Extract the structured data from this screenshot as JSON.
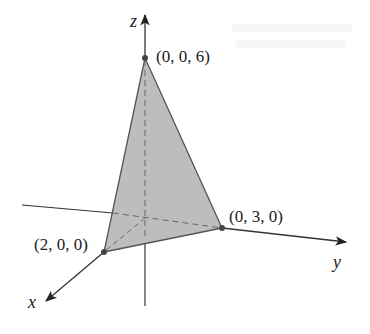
{
  "diagram": {
    "type": "3d-coordinate-plane-intercepts",
    "axes": {
      "x": {
        "label": "x"
      },
      "y": {
        "label": "y"
      },
      "z": {
        "label": "z"
      }
    },
    "points": [
      {
        "id": "z_intercept",
        "label": "(0, 0, 6)"
      },
      {
        "id": "y_intercept",
        "label": "(0, 3, 0)"
      },
      {
        "id": "x_intercept",
        "label": "(2, 0, 0)"
      }
    ],
    "colors": {
      "axis": "#333333",
      "triangle_fill": "#bdbdbd",
      "triangle_edge": "#555555",
      "hidden_dash": "#666666",
      "point": "#444444",
      "background": "#ffffff"
    }
  }
}
